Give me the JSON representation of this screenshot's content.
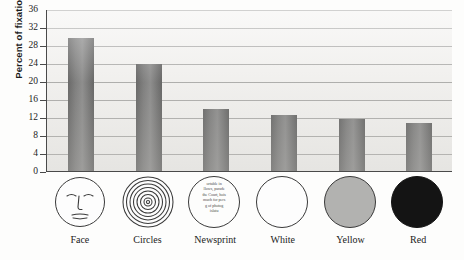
{
  "chart_data": {
    "type": "bar",
    "title": "",
    "subtitle": "",
    "xlabel": "",
    "ylabel": "Percent of fixation time",
    "ylim": [
      0,
      36
    ],
    "ytick_step": 4,
    "yticks": [
      "36",
      "32",
      "28",
      "24",
      "20",
      "16",
      "12",
      "8",
      "4",
      "0"
    ],
    "grid": true,
    "legend": "none",
    "categories": [
      "Face",
      "Circles",
      "Newsprint",
      "White",
      "Yellow",
      "Red"
    ],
    "values": [
      29.5,
      23.7,
      13.7,
      12.4,
      11.6,
      10.6
    ],
    "series": [
      {
        "name": "Percent of fixation time",
        "values": [
          29.5,
          23.7,
          13.7,
          12.4,
          11.6,
          10.6
        ]
      }
    ],
    "bar_color": "#555555",
    "plot_background": "#f2f1ef",
    "axis_color": "#4a4a4a",
    "gridline_color": "#9a9a98"
  },
  "axis": {
    "y_title": "Percent of fixation time",
    "ticks": [
      {
        "label": "36",
        "value": 36
      },
      {
        "label": "32",
        "value": 32
      },
      {
        "label": "28",
        "value": 28
      },
      {
        "label": "24",
        "value": 24
      },
      {
        "label": "20",
        "value": 20
      },
      {
        "label": "16",
        "value": 16
      },
      {
        "label": "12",
        "value": 12
      },
      {
        "label": "8",
        "value": 8
      },
      {
        "label": "4",
        "value": 4
      },
      {
        "label": "0",
        "value": 0
      }
    ]
  },
  "categories": [
    {
      "label": "Face",
      "value": 29.5,
      "icon": "face-icon",
      "icon_fill": "#fdfdfd"
    },
    {
      "label": "Circles",
      "value": 23.7,
      "icon": "concentric-circles-icon",
      "icon_fill": "#fdfdfd"
    },
    {
      "label": "Newsprint",
      "value": 13.7,
      "icon": "newsprint-icon",
      "icon_fill": "#fdfdfd",
      "newsprint_lines": [
        "ortable in",
        "llows, parade",
        "the Court, hois",
        "much for pers",
        "g of photog",
        "islatu"
      ]
    },
    {
      "label": "White",
      "value": 12.4,
      "icon": "white-disc-icon",
      "icon_fill": "#fdfdfd"
    },
    {
      "label": "Yellow",
      "value": 11.6,
      "icon": "yellow-disc-icon",
      "icon_fill": "#b2b2b0"
    },
    {
      "label": "Red",
      "value": 10.6,
      "icon": "red-disc-icon",
      "icon_fill": "#141414"
    }
  ]
}
